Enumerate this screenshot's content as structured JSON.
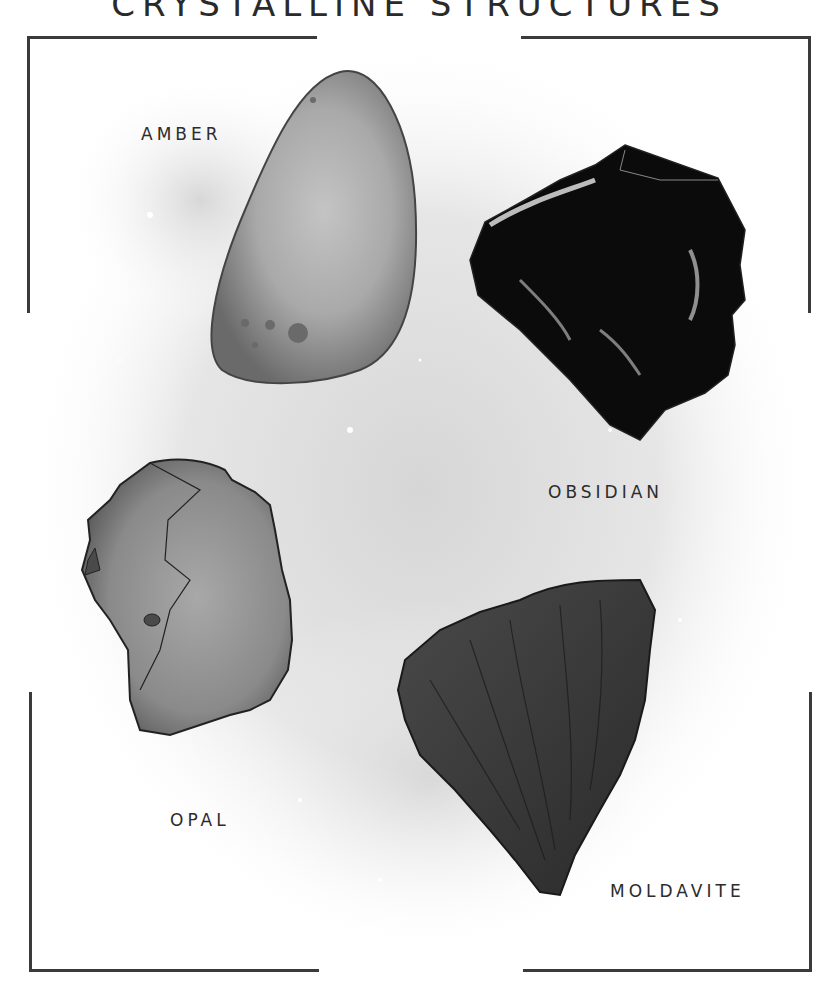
{
  "title": "CRYSTALLINE STRUCTURES",
  "stones": [
    {
      "name": "AMBER",
      "shape": "smooth teardrop",
      "fill": "#8a8a8a"
    },
    {
      "name": "OBSIDIAN",
      "shape": "angular shard",
      "fill": "#0a0a0a"
    },
    {
      "name": "OPAL",
      "shape": "irregular rough",
      "fill": "#7a7a7a"
    },
    {
      "name": "MOLDAVITE",
      "shape": "wrinkled triangular",
      "fill": "#383838"
    }
  ],
  "colors": {
    "frame": "#3a3a3a",
    "text": "#2c2c2c",
    "background": "#ffffff"
  }
}
